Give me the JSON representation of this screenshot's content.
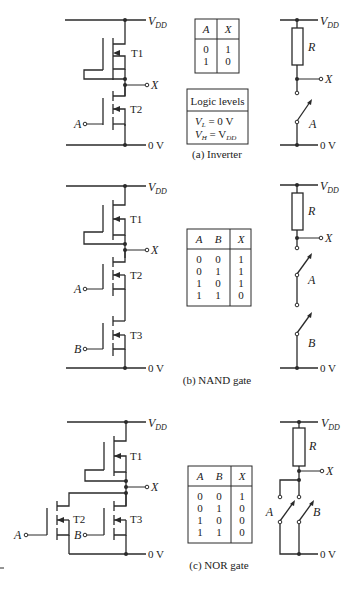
{
  "labels": {
    "vdd_main": "V",
    "vdd_sub": "DD",
    "zero_v": "0 V",
    "x": "X",
    "a": "A",
    "b": "B",
    "r": "R",
    "t1": "T1",
    "t2": "T2",
    "t3": "T3"
  },
  "inverter": {
    "caption": "(a) Inverter",
    "truth_table": {
      "headers": [
        "A",
        "X"
      ],
      "rows": [
        [
          "0",
          "1"
        ],
        [
          "1",
          "0"
        ]
      ]
    },
    "logic_levels": {
      "title": "Logic levels",
      "vl": "V",
      "vl_sub": "L",
      "vl_rest": " = 0 V",
      "vh": "V",
      "vh_sub": "H",
      "vh_eq": " = V",
      "vh_rest_sub": "DD"
    }
  },
  "nand": {
    "caption": "(b) NAND gate",
    "truth_table": {
      "headers": [
        "A",
        "B",
        "X"
      ],
      "rows": [
        [
          "0",
          "0",
          "1"
        ],
        [
          "0",
          "1",
          "1"
        ],
        [
          "1",
          "0",
          "1"
        ],
        [
          "1",
          "1",
          "0"
        ]
      ]
    }
  },
  "nor": {
    "caption": "(c) NOR gate",
    "truth_table": {
      "headers": [
        "A",
        "B",
        "X"
      ],
      "rows": [
        [
          "0",
          "0",
          "1"
        ],
        [
          "0",
          "1",
          "0"
        ],
        [
          "1",
          "0",
          "0"
        ],
        [
          "1",
          "1",
          "0"
        ]
      ]
    }
  }
}
